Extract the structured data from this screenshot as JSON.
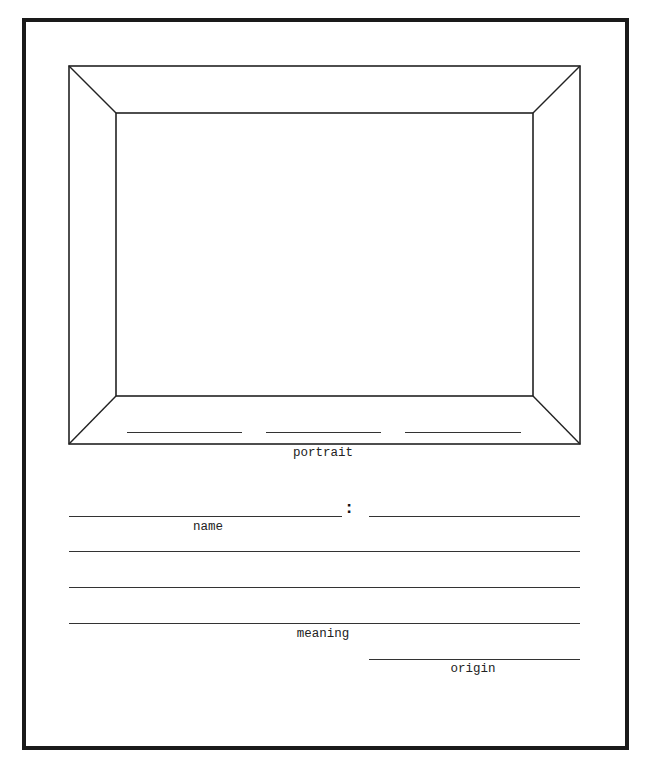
{
  "worksheet": {
    "portrait_section": {
      "caption": "portrait",
      "caption_lines_count": 3
    },
    "name_section": {
      "label": "name",
      "separator": ":"
    },
    "meaning_section": {
      "label": "meaning",
      "line_count": 3
    },
    "origin_section": {
      "label": "origin"
    }
  }
}
